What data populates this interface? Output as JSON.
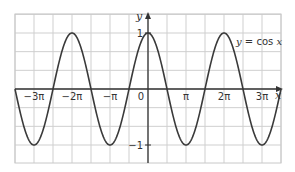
{
  "chart_data": {
    "type": "line",
    "title": "",
    "xlabel": "x",
    "ylabel": "y",
    "function": "y = cos x",
    "xlim_pi": [
      -3.5,
      3.5
    ],
    "ylim": [
      -1.33,
      1.33
    ],
    "grid": true,
    "grid_step_x_pi": 0.5,
    "grid_step_y": 0.333,
    "x_ticks": [
      {
        "value_pi": -3,
        "label": "−3π"
      },
      {
        "value_pi": -2,
        "label": "−2π"
      },
      {
        "value_pi": -1,
        "label": "−π"
      },
      {
        "value_pi": 0,
        "label": "0"
      },
      {
        "value_pi": 1,
        "label": "π"
      },
      {
        "value_pi": 2,
        "label": "2π"
      },
      {
        "value_pi": 3,
        "label": "3π"
      }
    ],
    "y_ticks": [
      {
        "value": 1,
        "label": "1"
      },
      {
        "value": -1,
        "label": "−1"
      }
    ],
    "series": [
      {
        "name": "y = cos x",
        "label_parts": {
          "y": "y",
          "eq": " = cos ",
          "x": "x"
        },
        "key_points": [
          {
            "x_pi": -3,
            "y": -1
          },
          {
            "x_pi": -2,
            "y": 1
          },
          {
            "x_pi": -1,
            "y": -1
          },
          {
            "x_pi": 0,
            "y": 1
          },
          {
            "x_pi": 1,
            "y": -1
          },
          {
            "x_pi": 2,
            "y": 1
          },
          {
            "x_pi": 3,
            "y": -1
          }
        ]
      }
    ],
    "colors": {
      "curve": "#3a3a3a",
      "axes": "#333333",
      "grid": "#cfcfcf",
      "frame": "#c8c8c8"
    }
  }
}
